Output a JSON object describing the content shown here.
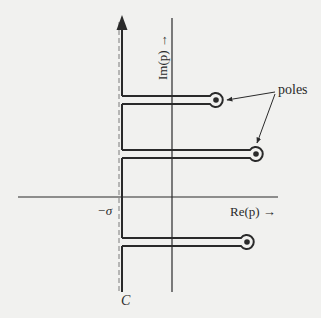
{
  "diagram": {
    "type": "complex-plane contour (Bromwich contour with keyhole detours around poles)",
    "labels": {
      "imaginary_axis": "Im(p) →",
      "real_axis": "Re(p) →",
      "sigma": "−σ",
      "contour": "C",
      "poles": "poles"
    },
    "colors": {
      "background": "#f1f1ef",
      "ink": "#2a2a2a",
      "dashed_line": "#7a7a7a"
    },
    "elements": {
      "real_axis": {
        "x1": 18,
        "x2": 278,
        "y": 197
      },
      "imaginary_axis": {
        "x": 172,
        "y1": 18,
        "y2": 292
      },
      "sigma_line_dashed": {
        "x": 119,
        "y1": 20,
        "y2": 292
      },
      "contour_C": {
        "x": 122,
        "arrow_tip_y": 16,
        "bottom_y": 292,
        "direction": "upward"
      },
      "pole_detours": [
        {
          "pole_center": [
            216,
            100
          ],
          "upper_y": 96,
          "lower_y": 104
        },
        {
          "pole_center": [
            256,
            154
          ],
          "upper_y": 150,
          "lower_y": 158
        },
        {
          "pole_center": [
            247,
            242
          ],
          "upper_y": 238,
          "lower_y": 246
        }
      ],
      "pole_pointer_arrows": [
        {
          "from": [
            275,
            92
          ],
          "to": [
            229,
            100
          ]
        },
        {
          "from": [
            275,
            92
          ],
          "to": [
            257,
            142
          ]
        }
      ]
    }
  }
}
